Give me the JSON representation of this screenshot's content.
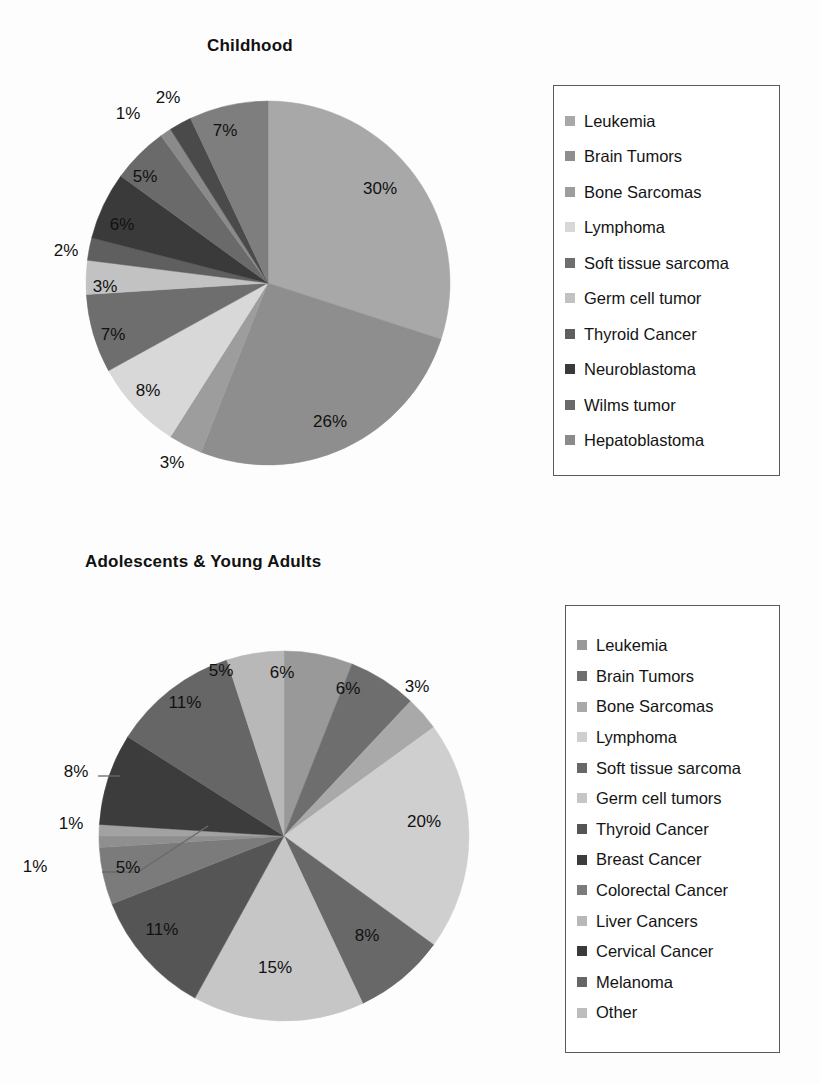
{
  "page": {
    "background": "#fdfdfd",
    "text_color": "#111111"
  },
  "charts": [
    {
      "id": "childhood",
      "title": "Childhood",
      "legend_box": {
        "border_color": "#5a5a5a"
      }
    },
    {
      "id": "aya",
      "title": "Adolescents & Young Adults",
      "legend_box": {
        "border_color": "#5a5a5a"
      }
    }
  ],
  "chart_data": [
    {
      "type": "pie",
      "title": "Childhood",
      "xlabel": "",
      "ylabel": "",
      "legend_position": "right",
      "grid": false,
      "start_angle_deg": 0,
      "direction": "clockwise",
      "labels_unit": "%",
      "categories": [
        "Leukemia",
        "Brain Tumors",
        "Bone Sarcomas",
        "Lymphoma",
        "Soft tissue sarcoma",
        "Germ cell tumor",
        "Thyroid Cancer",
        "Neuroblastoma",
        "Wilms tumor",
        "Hepatoblastoma"
      ],
      "values": [
        30,
        26,
        3,
        8,
        7,
        3,
        2,
        6,
        5,
        1
      ],
      "colors": [
        "#a8a8a8",
        "#8e8e8e",
        "#9d9d9d",
        "#d8d8d8",
        "#6e6e6e",
        "#c2c2c2",
        "#5f5f5f",
        "#3a3a3a",
        "#6a6a6a",
        "#8a8a8a"
      ],
      "data_labels": [
        "30%",
        "26%",
        "3%",
        "8%",
        "7%",
        "3%",
        "2%",
        "6%",
        "5%",
        "1%"
      ],
      "extra_slices": [
        {
          "label": "2%",
          "value": 2,
          "color": "#4a4a4a"
        },
        {
          "label": "7%",
          "value": 7,
          "color": "#7e7e7e"
        }
      ],
      "note": "twelve wedges are drawn; the two unnamed thin/top wedges carry labels 2% and 7%"
    },
    {
      "type": "pie",
      "title": "Adolescents & Young Adults",
      "xlabel": "",
      "ylabel": "",
      "legend_position": "right",
      "grid": false,
      "start_angle_deg": 0,
      "direction": "clockwise",
      "labels_unit": "%",
      "categories": [
        "Leukemia",
        "Brain Tumors",
        "Bone Sarcomas",
        "Lymphoma",
        "Soft tissue sarcoma",
        "Germ cell tumors",
        "Thyroid Cancer",
        "Breast Cancer",
        "Colorectal Cancer",
        "Liver Cancers",
        "Cervical Cancer",
        "Melanoma",
        "Other"
      ],
      "values": [
        6,
        6,
        3,
        20,
        8,
        15,
        11,
        5,
        1,
        1,
        8,
        11,
        5
      ],
      "colors": [
        "#999999",
        "#6e6e6e",
        "#a9a9a9",
        "#cfcfcf",
        "#686868",
        "#c6c6c6",
        "#555555",
        "#7b7b7b",
        "#8f8f8f",
        "#a2a2a2",
        "#3c3c3c",
        "#666666",
        "#b8b8b8"
      ],
      "data_labels": [
        "6%",
        "6%",
        "3%",
        "20%",
        "8%",
        "15%",
        "11%",
        "5%",
        "1%",
        "1%",
        "8%",
        "11%",
        "5%"
      ]
    }
  ],
  "childhood": {
    "title": "Childhood",
    "slice_labels": [
      {
        "text": "1%",
        "x": 128,
        "y": 114
      },
      {
        "text": "2%",
        "x": 168,
        "y": 98
      },
      {
        "text": "7%",
        "x": 225,
        "y": 131
      },
      {
        "text": "30%",
        "x": 380,
        "y": 189
      },
      {
        "text": "5%",
        "x": 145,
        "y": 177
      },
      {
        "text": "6%",
        "x": 122,
        "y": 225
      },
      {
        "text": "2%",
        "x": 66,
        "y": 251
      },
      {
        "text": "3%",
        "x": 105,
        "y": 287
      },
      {
        "text": "7%",
        "x": 113,
        "y": 335
      },
      {
        "text": "8%",
        "x": 148,
        "y": 391
      },
      {
        "text": "3%",
        "x": 172,
        "y": 463
      },
      {
        "text": "26%",
        "x": 330,
        "y": 422
      }
    ],
    "legend": [
      {
        "label": "Leukemia",
        "color": "#a8a8a8"
      },
      {
        "label": "Brain Tumors",
        "color": "#8e8e8e"
      },
      {
        "label": "Bone Sarcomas",
        "color": "#9d9d9d"
      },
      {
        "label": "Lymphoma",
        "color": "#d8d8d8"
      },
      {
        "label": "Soft tissue sarcoma",
        "color": "#6e6e6e"
      },
      {
        "label": "Germ cell tumor",
        "color": "#c2c2c2"
      },
      {
        "label": "Thyroid Cancer",
        "color": "#5f5f5f"
      },
      {
        "label": "Neuroblastoma",
        "color": "#3a3a3a"
      },
      {
        "label": "Wilms tumor",
        "color": "#6a6a6a"
      },
      {
        "label": "Hepatoblastoma",
        "color": "#8a8a8a"
      }
    ]
  },
  "aya": {
    "title": "Adolescents & Young Adults",
    "slice_labels": [
      {
        "text": "5%",
        "x": 221,
        "y": 671
      },
      {
        "text": "6%",
        "x": 282,
        "y": 673
      },
      {
        "text": "6%",
        "x": 348,
        "y": 689
      },
      {
        "text": "3%",
        "x": 417,
        "y": 687
      },
      {
        "text": "11%",
        "x": 185,
        "y": 703
      },
      {
        "text": "8%",
        "x": 76,
        "y": 772
      },
      {
        "text": "1%",
        "x": 71,
        "y": 824
      },
      {
        "text": "1%",
        "x": 35,
        "y": 867
      },
      {
        "text": "5%",
        "x": 128,
        "y": 868
      },
      {
        "text": "20%",
        "x": 424,
        "y": 822
      },
      {
        "text": "11%",
        "x": 162,
        "y": 930
      },
      {
        "text": "8%",
        "x": 367,
        "y": 936
      },
      {
        "text": "15%",
        "x": 275,
        "y": 968
      }
    ],
    "legend": [
      {
        "label": "Leukemia",
        "color": "#999999"
      },
      {
        "label": "Brain Tumors",
        "color": "#6e6e6e"
      },
      {
        "label": "Bone Sarcomas",
        "color": "#a9a9a9"
      },
      {
        "label": "Lymphoma",
        "color": "#cfcfcf"
      },
      {
        "label": "Soft tissue sarcoma",
        "color": "#686868"
      },
      {
        "label": "Germ cell tumors",
        "color": "#c6c6c6"
      },
      {
        "label": "Thyroid Cancer",
        "color": "#555555"
      },
      {
        "label": "Breast Cancer",
        "color": "#3c3c3c"
      },
      {
        "label": "Colorectal Cancer",
        "color": "#7b7b7b"
      },
      {
        "label": "Liver Cancers",
        "color": "#b8b8b8"
      },
      {
        "label": "Cervical Cancer",
        "color": "#3a3a3a"
      },
      {
        "label": "Melanoma",
        "color": "#666666"
      },
      {
        "label": "Other",
        "color": "#bdbdbd"
      }
    ]
  }
}
